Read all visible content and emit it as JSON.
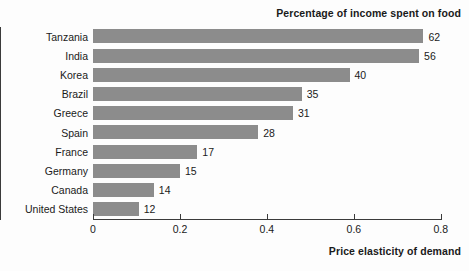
{
  "chart_data": {
    "type": "bar",
    "orientation": "horizontal",
    "title": "Percentage of income spent on food",
    "xlabel": "Price elasticity of demand",
    "ylabel": "",
    "xlim": [
      0,
      0.805
    ],
    "xticks": [
      0,
      0.2,
      0.4,
      0.6,
      0.8
    ],
    "xtick_labels": [
      "0",
      "0.2",
      "0.4",
      "0.6",
      "0.8"
    ],
    "grid": false,
    "legend": null,
    "bar_color": "#8c8c8c",
    "categories": [
      "Tanzania",
      "India",
      "Korea",
      "Brazil",
      "Greece",
      "Spain",
      "France",
      "Germany",
      "Canada",
      "United States"
    ],
    "values": [
      0.76,
      0.75,
      0.59,
      0.48,
      0.46,
      0.38,
      0.24,
      0.2,
      0.14,
      0.105
    ],
    "data_labels": [
      "62",
      "56",
      "40",
      "35",
      "31",
      "28",
      "17",
      "15",
      "14",
      "12"
    ],
    "data_label_meaning": "Percentage of income spent on food",
    "rows": [
      {
        "category": "Tanzania",
        "value": 0.76,
        "label": "62"
      },
      {
        "category": "India",
        "value": 0.75,
        "label": "56"
      },
      {
        "category": "Korea",
        "value": 0.59,
        "label": "40"
      },
      {
        "category": "Brazil",
        "value": 0.48,
        "label": "35"
      },
      {
        "category": "Greece",
        "value": 0.46,
        "label": "31"
      },
      {
        "category": "Spain",
        "value": 0.38,
        "label": "28"
      },
      {
        "category": "France",
        "value": 0.24,
        "label": "17"
      },
      {
        "category": "Germany",
        "value": 0.2,
        "label": "15"
      },
      {
        "category": "Canada",
        "value": 0.14,
        "label": "14"
      },
      {
        "category": "United States",
        "value": 0.105,
        "label": "12"
      }
    ]
  }
}
